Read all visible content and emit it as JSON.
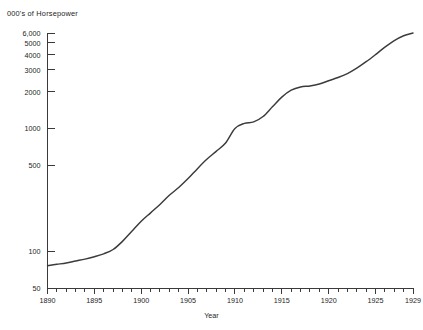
{
  "chart_data": {
    "type": "line",
    "title": "",
    "ylabel": "000's of Horsepower",
    "xlabel": "Year",
    "yscale": "log",
    "ylim": [
      50,
      6800
    ],
    "xlim": [
      1890,
      1929
    ],
    "grid": false,
    "legend": "none",
    "y_ticks": [
      {
        "value": 50,
        "label": "50"
      },
      {
        "value": 100,
        "label": "100"
      },
      {
        "value": 500,
        "label": "500"
      },
      {
        "value": 1000,
        "label": "1000"
      },
      {
        "value": 2000,
        "label": "2000"
      },
      {
        "value": 3000,
        "label": "3000"
      },
      {
        "value": 4000,
        "label": "4000"
      },
      {
        "value": 5000,
        "label": "5000"
      },
      {
        "value": 6000,
        "label": "6,000"
      }
    ],
    "x_ticks": [
      {
        "value": 1890,
        "label": "1890"
      },
      {
        "value": 1895,
        "label": "1895"
      },
      {
        "value": 1900,
        "label": "1900"
      },
      {
        "value": 1905,
        "label": "1905"
      },
      {
        "value": 1910,
        "label": "1910"
      },
      {
        "value": 1915,
        "label": "1915"
      },
      {
        "value": 1920,
        "label": "1920"
      },
      {
        "value": 1925,
        "label": "1925"
      },
      {
        "value": 1929,
        "label": "1929"
      }
    ],
    "x_minor_ticks": [
      1891,
      1892,
      1893,
      1894,
      1896,
      1897,
      1898,
      1899,
      1901,
      1902,
      1903,
      1904,
      1906,
      1907,
      1908,
      1909,
      1911,
      1912,
      1913,
      1914,
      1916,
      1917,
      1918,
      1919,
      1921,
      1922,
      1923,
      1924,
      1926,
      1927,
      1928
    ],
    "series": [
      {
        "name": "Horsepower",
        "color": "#3b3b3b",
        "x": [
          1890,
          1891,
          1892,
          1893,
          1894,
          1895,
          1896,
          1897,
          1898,
          1899,
          1900,
          1901,
          1902,
          1903,
          1904,
          1905,
          1906,
          1907,
          1908,
          1909,
          1910,
          1911,
          1912,
          1913,
          1914,
          1915,
          1916,
          1917,
          1918,
          1919,
          1920,
          1921,
          1922,
          1923,
          1924,
          1925,
          1926,
          1927,
          1928,
          1929
        ],
        "values": [
          76,
          78,
          80,
          83,
          86,
          90,
          95,
          103,
          120,
          145,
          175,
          205,
          240,
          285,
          330,
          390,
          470,
          560,
          650,
          760,
          1000,
          1100,
          1130,
          1250,
          1500,
          1800,
          2050,
          2180,
          2220,
          2300,
          2450,
          2600,
          2800,
          3100,
          3500,
          4000,
          4600,
          5200,
          5700,
          6000
        ]
      }
    ]
  }
}
